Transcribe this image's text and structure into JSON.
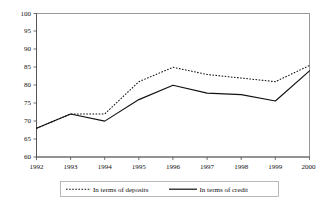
{
  "chart_data": {
    "type": "line",
    "title": "",
    "subtitle": "",
    "xlabel": "",
    "ylabel": "",
    "categories": [
      "1992",
      "1993",
      "1994",
      "1995",
      "1996",
      "1997",
      "1998",
      "1999",
      "2000"
    ],
    "x": [
      1992,
      1993,
      1994,
      1995,
      1996,
      1997,
      1998,
      1999,
      2000
    ],
    "ylim": [
      60,
      100
    ],
    "yticks": [
      60,
      65,
      70,
      75,
      80,
      85,
      90,
      95,
      100
    ],
    "ytick_labels": [
      "60",
      "65",
      "70",
      "75",
      "80",
      "85",
      "90",
      "95",
      "100"
    ],
    "xtick_labels": [
      "1992",
      "1993",
      "1994",
      "1995",
      "1996",
      "1997",
      "1998",
      "1999",
      "2000"
    ],
    "grid": false,
    "legend_position": "bottom",
    "series": [
      {
        "name": "In terms of deposits",
        "style": "dotted",
        "color": "#111111",
        "values": [
          68,
          72,
          72,
          81,
          85,
          83,
          82,
          81,
          85.5
        ]
      },
      {
        "name": "In terms of credit",
        "style": "solid",
        "color": "#111111",
        "values": [
          68,
          72,
          70,
          76,
          80,
          77.8,
          77.4,
          75.6,
          84
        ]
      }
    ]
  },
  "legend": {
    "entries": [
      {
        "label": "In terms of deposits",
        "style": "dotted"
      },
      {
        "label": "In terms of credit",
        "style": "solid"
      }
    ]
  }
}
